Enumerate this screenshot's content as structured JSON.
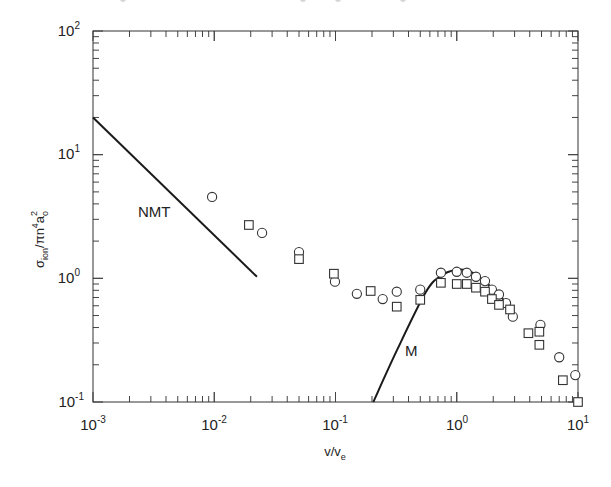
{
  "chart_data": {
    "type": "scatter",
    "title": "",
    "xlabel": "v/v_e",
    "ylabel": "σ_ion/πn⁴a₀²",
    "xscale": "log",
    "yscale": "log",
    "xlim": [
      0.001,
      10
    ],
    "ylim": [
      0.1,
      100
    ],
    "grid": false,
    "legend": null,
    "x_tick_labels": [
      "10^-3",
      "10^-2",
      "10^-1",
      "10^0",
      "10^1"
    ],
    "y_tick_labels": [
      "10^-1",
      "10^0",
      "10^1",
      "10^2"
    ],
    "annotations": [
      {
        "text": "NMT",
        "x": 0.0032,
        "y": 3.2
      },
      {
        "text": "M",
        "x": 0.32,
        "y": 0.3
      }
    ],
    "series": [
      {
        "name": "circles",
        "marker": "circle",
        "points": [
          [
            0.0096,
            4.55
          ],
          [
            0.0248,
            2.33
          ],
          [
            0.05,
            1.63
          ],
          [
            0.099,
            0.94
          ],
          [
            0.15,
            0.75
          ],
          [
            0.245,
            0.68
          ],
          [
            0.32,
            0.78
          ],
          [
            0.5,
            0.81
          ],
          [
            0.74,
            1.11
          ],
          [
            1.0,
            1.13
          ],
          [
            1.21,
            1.11
          ],
          [
            1.44,
            1.03
          ],
          [
            1.71,
            0.95
          ],
          [
            1.95,
            0.81
          ],
          [
            2.23,
            0.74
          ],
          [
            2.55,
            0.63
          ],
          [
            2.9,
            0.49
          ],
          [
            4.9,
            0.42
          ],
          [
            7.0,
            0.23
          ],
          [
            9.5,
            0.165
          ]
        ]
      },
      {
        "name": "squares",
        "marker": "square",
        "points": [
          [
            0.0193,
            2.7
          ],
          [
            0.05,
            1.43
          ],
          [
            0.097,
            1.09
          ],
          [
            0.195,
            0.79
          ],
          [
            0.32,
            0.59
          ],
          [
            0.5,
            0.67
          ],
          [
            0.74,
            0.92
          ],
          [
            1.0,
            0.9
          ],
          [
            1.21,
            0.9
          ],
          [
            1.44,
            0.84
          ],
          [
            1.71,
            0.78
          ],
          [
            1.95,
            0.68
          ],
          [
            2.23,
            0.61
          ],
          [
            2.75,
            0.56
          ],
          [
            3.9,
            0.36
          ],
          [
            4.8,
            0.37
          ],
          [
            4.8,
            0.29
          ],
          [
            7.5,
            0.15
          ],
          [
            10.0,
            0.1
          ]
        ]
      },
      {
        "name": "NMT",
        "marker": "line",
        "points": [
          [
            0.001,
            20.0
          ],
          [
            0.0225,
            1.03
          ]
        ]
      },
      {
        "name": "M",
        "marker": "line",
        "points": [
          [
            0.205,
            0.1
          ],
          [
            0.32,
            0.26
          ],
          [
            0.55,
            0.76
          ],
          [
            0.73,
            1.04
          ],
          [
            0.98,
            1.17
          ],
          [
            1.3,
            1.13
          ],
          [
            1.9,
            0.86
          ],
          [
            2.7,
            0.6
          ]
        ]
      }
    ]
  },
  "axes": {
    "x_title": "v/v",
    "x_title_sub": "e",
    "y_title_main": "σ",
    "y_title_sub1": "ion",
    "y_title_mid": "/πn",
    "y_title_sup": "4",
    "y_title_a": "a",
    "y_title_sub2": "o",
    "y_title_sup2": "2"
  },
  "labels": {
    "nmt": "NMT",
    "m": "M"
  },
  "ticks": {
    "x": [
      {
        "base": "10",
        "exp": "-3"
      },
      {
        "base": "10",
        "exp": "-2"
      },
      {
        "base": "10",
        "exp": "-1"
      },
      {
        "base": "10",
        "exp": "0"
      },
      {
        "base": "10",
        "exp": "1"
      }
    ],
    "y": [
      {
        "base": "10",
        "exp": "-1"
      },
      {
        "base": "10",
        "exp": "0"
      },
      {
        "base": "10",
        "exp": "1"
      },
      {
        "base": "10",
        "exp": "2"
      }
    ]
  }
}
